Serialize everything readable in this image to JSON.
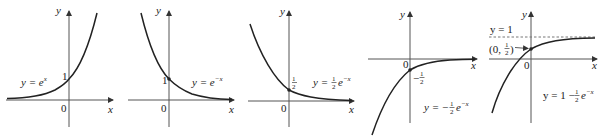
{
  "figure": {
    "panels": [
      {
        "id": "p1",
        "equation": "y = e^x",
        "eq_main": "y = e",
        "eq_sup": "x",
        "intercept_label": "1",
        "origin_label": "0",
        "x_label": "x",
        "y_label": "y"
      },
      {
        "id": "p2",
        "equation": "y = e^-x",
        "eq_main": "y = e",
        "eq_sup": "−x",
        "intercept_label": "1",
        "origin_label": "0",
        "x_label": "x",
        "y_label": "y"
      },
      {
        "id": "p3",
        "equation": "y = (1/2)e^-x",
        "eq_pre": "y =",
        "eq_frac_num": "1",
        "eq_frac_den": "2",
        "eq_main": "e",
        "eq_sup": "−x",
        "intercept_num": "1",
        "intercept_den": "2",
        "origin_label": "0",
        "x_label": "x",
        "y_label": "y"
      },
      {
        "id": "p4",
        "equation": "y = -(1/2)e^-x",
        "eq_pre": "y = −",
        "eq_frac_num": "1",
        "eq_frac_den": "2",
        "eq_main": "e",
        "eq_sup": "−x",
        "intercept_sign": "−",
        "intercept_num": "1",
        "intercept_den": "2",
        "origin_label": "0",
        "x_label": "x",
        "y_label": "y"
      },
      {
        "id": "p5",
        "equation": "y = 1 - (1/2)e^-x",
        "eq_pre": "y = 1 −",
        "eq_frac_num": "1",
        "eq_frac_den": "2",
        "eq_main": "e",
        "eq_sup": "−x",
        "asymptote_label": "y = 1",
        "point_label_pre": "(0,",
        "point_num": "1",
        "point_den": "2",
        "point_label_post": ")",
        "origin_label": "0",
        "x_label": "x",
        "y_label": "y"
      }
    ]
  }
}
